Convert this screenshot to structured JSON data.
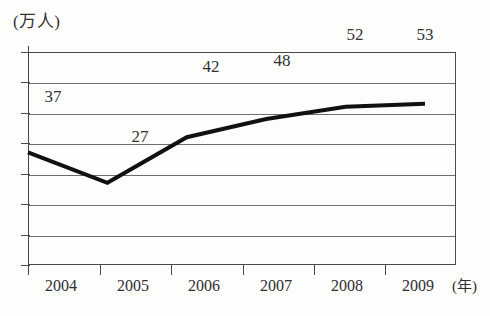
{
  "chart_data": {
    "type": "line",
    "title": "",
    "ylabel": "(万人)",
    "xlabel": "(年)",
    "categories": [
      "2004",
      "2005",
      "2006",
      "2007",
      "2008",
      "2009"
    ],
    "values": [
      37,
      27,
      42,
      48,
      52,
      53
    ],
    "series": [
      {
        "name": "",
        "values": [
          37,
          27,
          42,
          48,
          52,
          53
        ]
      }
    ],
    "data_labels": [
      "37",
      "27",
      "42",
      "48",
      "52",
      "53"
    ],
    "ylim": [
      0,
      70
    ],
    "y_tick_labels": [],
    "gridlines": 6,
    "grid": true,
    "legend": "none",
    "line_color": "#111111",
    "grid_color": "#6e6e6e",
    "axis_color": "#4a4a4a"
  },
  "axes": {
    "y_unit_caption": "(万人)",
    "x_unit_caption": "(年)"
  }
}
